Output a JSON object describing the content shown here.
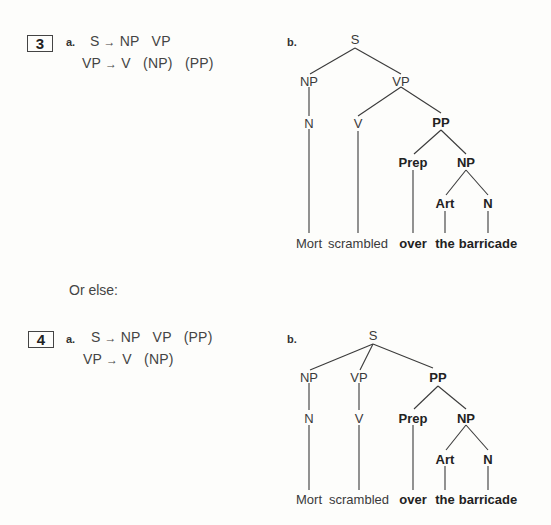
{
  "example3": {
    "number": "3",
    "part_a_label": "a.",
    "rules": [
      {
        "lhs": "S",
        "arrow": "→",
        "rhs": "NP   VP"
      },
      {
        "lhs": "VP",
        "arrow": "→",
        "rhs": "V   (NP)   (PP)"
      }
    ],
    "part_b_label": "b.",
    "tree": {
      "nodes": {
        "S": "S",
        "NP": "NP",
        "VP": "VP",
        "N": "N",
        "V": "V",
        "PP": "PP",
        "Prep": "Prep",
        "NP2": "NP",
        "Art": "Art",
        "N2": "N"
      },
      "words": [
        "Mort",
        "scrambled",
        "over",
        "the",
        "barricade"
      ]
    }
  },
  "connector": {
    "text": "Or else:"
  },
  "example4": {
    "number": "4",
    "part_a_label": "a.",
    "rules": [
      {
        "lhs": "S",
        "arrow": "→",
        "rhs": "NP   VP   (PP)"
      },
      {
        "lhs": "VP",
        "arrow": "→",
        "rhs": "V   (NP)"
      }
    ],
    "part_b_label": "b.",
    "tree": {
      "nodes": {
        "S": "S",
        "NP": "NP",
        "VP": "VP",
        "N": "N",
        "V": "V",
        "PP": "PP",
        "Prep": "Prep",
        "NP2": "NP",
        "Art": "Art",
        "N2": "N"
      },
      "words": [
        "Mort",
        "scrambled",
        "over",
        "the",
        "barricade"
      ]
    }
  }
}
